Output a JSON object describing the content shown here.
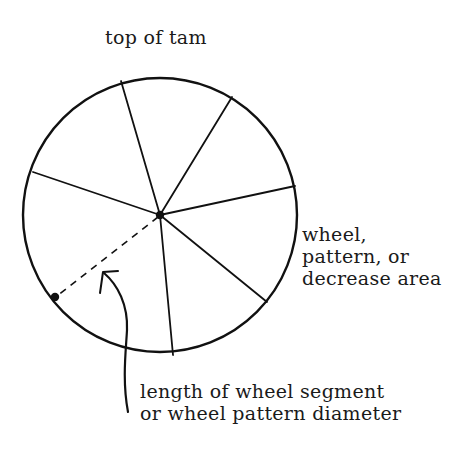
{
  "diagram": {
    "title": "top of tam",
    "area_label": {
      "lines": [
        "wheel,",
        "pattern, or",
        "decrease area"
      ]
    },
    "length_label": {
      "lines": [
        "length of wheel segment",
        "or wheel pattern diameter"
      ]
    },
    "colors": {
      "stroke": "#111111",
      "background": "#ffffff"
    },
    "shapes": {
      "circle": {
        "cx": 160,
        "cy": 215,
        "r": 137
      },
      "center_dot": {
        "cx": 160,
        "cy": 215
      },
      "edge_dot": {
        "cx": 55,
        "cy": 297
      },
      "spokes": [
        {
          "x": 121,
          "y": 81
        },
        {
          "x": 232,
          "y": 97
        },
        {
          "x": 295,
          "y": 186
        },
        {
          "x": 267,
          "y": 302
        },
        {
          "x": 173,
          "y": 355
        },
        {
          "x": 33,
          "y": 172
        }
      ],
      "dashed_radius": {
        "from": [
          160,
          215
        ],
        "to": [
          55,
          297
        ]
      }
    }
  }
}
